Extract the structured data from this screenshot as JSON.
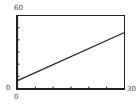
{
  "chart_data": {
    "type": "line",
    "title": "",
    "xlabel": "",
    "ylabel": "",
    "xlim": [
      0,
      30
    ],
    "ylim": [
      0,
      60
    ],
    "x_ticks_step": 5,
    "y_ticks_step": 10,
    "grid": false,
    "series": [
      {
        "name": "line",
        "x": [
          0,
          30
        ],
        "values": [
          6.5,
          46
        ]
      }
    ]
  },
  "labels": {
    "y_max": "60",
    "y_min": "0",
    "x_min": "0",
    "x_max": "30"
  }
}
